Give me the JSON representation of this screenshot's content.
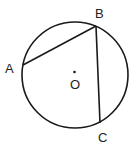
{
  "diagram": {
    "type": "circle-with-inscribed-angle",
    "circle": {
      "center": "O",
      "cx": 75,
      "cy": 75,
      "r": 53
    },
    "points": [
      {
        "name": "A",
        "x": 23,
        "y": 65,
        "label_x": 5,
        "label_y": 73
      },
      {
        "name": "B",
        "x": 96,
        "y": 26,
        "label_x": 95,
        "label_y": 18
      },
      {
        "name": "C",
        "x": 100,
        "y": 123,
        "label_x": 98,
        "label_y": 142
      }
    ],
    "center_label": {
      "name": "O",
      "x": 70,
      "y": 89,
      "dot_x": 74.5,
      "dot_y": 72
    },
    "segments": [
      {
        "from": "A",
        "to": "B"
      },
      {
        "from": "B",
        "to": "C"
      }
    ],
    "stroke_color": "#1a1a1a"
  }
}
